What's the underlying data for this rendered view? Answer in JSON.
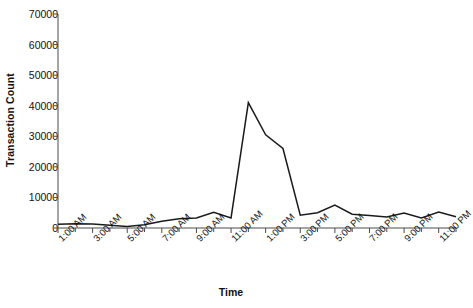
{
  "chart_data": {
    "type": "line",
    "title": "",
    "xlabel": "Time",
    "ylabel": "Transaction Count",
    "ylim": [
      0,
      70000
    ],
    "ytick_values": [
      0,
      10000,
      20000,
      30000,
      40000,
      50000,
      60000,
      70000
    ],
    "ytick_labels": [
      "0",
      "10000",
      "20000",
      "30000",
      "40000",
      "50000",
      "60000",
      "70000"
    ],
    "grid": false,
    "legend": "none",
    "line_color": "#1a1a1a",
    "x": [
      "1:00 AM",
      "2:00 AM",
      "3:00 AM",
      "4:00 AM",
      "5:00 AM",
      "6:00 AM",
      "7:00 AM",
      "8:00 AM",
      "9:00 AM",
      "10:00 AM",
      "11:00 AM",
      "12:00 PM",
      "1:00 PM",
      "2:00 PM",
      "3:00 PM",
      "4:00 PM",
      "5:00 PM",
      "6:00 PM",
      "7:00 PM",
      "8:00 PM",
      "9:00 PM",
      "10:00 PM",
      "11:00 PM",
      "12:00 AM"
    ],
    "xtick_labels": [
      "1:00 AM",
      "3:00 AM",
      "5:00 AM",
      "7:00 AM",
      "9:00 AM",
      "11:00 AM",
      "1:00 PM",
      "3:00 PM",
      "5:00 PM",
      "7:00 PM",
      "9:00 PM",
      "11:00 PM"
    ],
    "xtick_indices": [
      0,
      2,
      4,
      6,
      8,
      10,
      12,
      14,
      16,
      18,
      20,
      22
    ],
    "xtick_rotation": -45,
    "values": [
      1200,
      1400,
      1300,
      900,
      500,
      1100,
      2200,
      3000,
      3300,
      5100,
      3300,
      41000,
      30500,
      26000,
      4200,
      5000,
      7500,
      4500,
      4100,
      3600,
      4900,
      3300,
      5200,
      3700
    ],
    "annotations": [
      {
        "label": "peak",
        "x": "12:00 PM",
        "y": 41000
      }
    ]
  }
}
